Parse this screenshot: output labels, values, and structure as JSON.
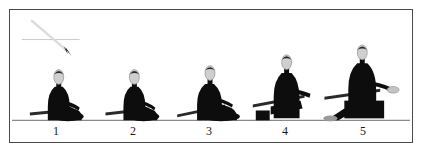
{
  "page": {
    "background_color": "#ffffff",
    "frame_border_color": "#4a4a4a",
    "top_cut_text": "·· ······· ······  ····"
  },
  "illustration": {
    "caption_none": "",
    "ground_line": {
      "color": "#8a8a8a",
      "y": 121
    },
    "annotation": {
      "name": "sword-arrow-annotation",
      "diagonal_color": "#d8d8d8",
      "horizontal_color": "#c9c9c9",
      "arrowhead_color": "#111111",
      "description": "diagonal sword blade crossing a horizontal guide line, dark arrowhead at lower right"
    },
    "body_color": "#0d0d0d",
    "head_fill": "#cfcfcf",
    "head_outline": "#8f8f8f",
    "sword_color": "#2a2a2a",
    "figures": [
      {
        "number": "1",
        "label": "1",
        "pose": "seated-seiza-rest",
        "x": 56
      },
      {
        "number": "2",
        "label": "2",
        "pose": "seated-hand-to-hilt",
        "x": 133
      },
      {
        "number": "3",
        "label": "3",
        "pose": "seated-begin-draw",
        "x": 209
      },
      {
        "number": "4",
        "label": "4",
        "pose": "rising-draw-forward",
        "x": 285
      },
      {
        "number": "5",
        "label": "5",
        "pose": "kneeling-full-extension",
        "x": 363
      }
    ]
  }
}
